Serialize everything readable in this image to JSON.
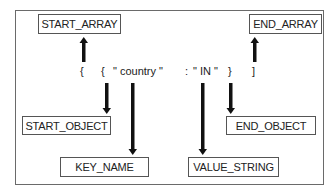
{
  "diagram": {
    "type": "json-parser-events",
    "tokens": [
      {
        "id": "open-array",
        "text": "{"
      },
      {
        "id": "open-object",
        "text": "{"
      },
      {
        "id": "key",
        "text": "\" country \""
      },
      {
        "id": "colon",
        "text": ":"
      },
      {
        "id": "value",
        "text": "\" IN \""
      },
      {
        "id": "close-object",
        "text": "}"
      },
      {
        "id": "close-array",
        "text": "]"
      }
    ],
    "events": {
      "start_array": "START_ARRAY",
      "end_array": "END_ARRAY",
      "start_object": "START_OBJECT",
      "end_object": "END_OBJECT",
      "key_name": "KEY_NAME",
      "value_string": "VALUE_STRING"
    },
    "edges": [
      {
        "from": "open-array",
        "to": "START_ARRAY",
        "direction": "up"
      },
      {
        "from": "close-array",
        "to": "END_ARRAY",
        "direction": "up"
      },
      {
        "from": "open-object",
        "to": "START_OBJECT",
        "direction": "down"
      },
      {
        "from": "key",
        "to": "KEY_NAME",
        "direction": "down"
      },
      {
        "from": "value",
        "to": "VALUE_STRING",
        "direction": "down"
      },
      {
        "from": "close-object",
        "to": "END_OBJECT",
        "direction": "down"
      }
    ],
    "colors": {
      "arrow": "#111111",
      "border": "#555555",
      "background": "#ffffff"
    }
  }
}
